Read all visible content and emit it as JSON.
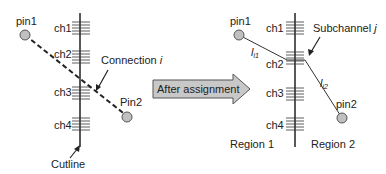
{
  "left_panel": {
    "pin1": "pin1",
    "pin2": "Pin2",
    "channels": [
      "ch1",
      "ch2",
      "ch3",
      "ch4"
    ],
    "connection_label": "Connection ",
    "connection_var": "i",
    "cutline_label": "Cutline"
  },
  "arrow": {
    "label": "After assignment",
    "fill": "#c8c8c8"
  },
  "right_panel": {
    "pin1": "pin1",
    "pin2": "pin2",
    "channels": [
      "ch1",
      "ch2",
      "ch3",
      "ch4"
    ],
    "subchannel_label": "Subchannel ",
    "subchannel_var": "j",
    "segment1": "l",
    "segment1_sub": "i1",
    "segment2": "l",
    "segment2_sub": "i2",
    "region1": "Region 1",
    "region2": "Region 2"
  },
  "colors": {
    "pin_fill": "#c0c0c0",
    "line": "#222222"
  }
}
